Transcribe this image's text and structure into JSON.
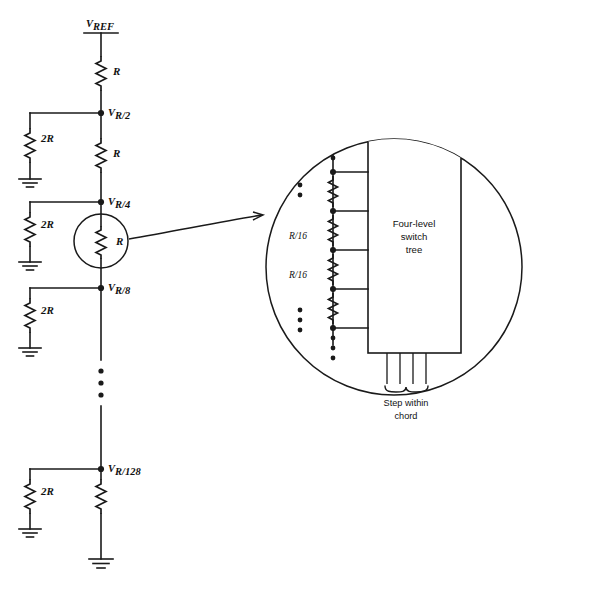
{
  "figure": {
    "background_color": "#ffffff",
    "line_color": "#1a1a1a"
  },
  "ladder": {
    "supply_label": "V",
    "supply_subscript": "REF",
    "series_resistor_label": "R",
    "shunt_resistor_label": "2R",
    "nodes": [
      {
        "label": "V",
        "subscript": "R/2"
      },
      {
        "label": "V",
        "subscript": "R/4"
      },
      {
        "label": "V",
        "subscript": "R/8"
      },
      {
        "label": "V",
        "subscript": "R/128"
      }
    ],
    "series_resistors": [
      "R",
      "R",
      "R"
    ],
    "shunt_resistors": [
      "2R",
      "2R",
      "2R",
      "2R"
    ],
    "ellipsis": "⋮",
    "ground_symbol": "gnd"
  },
  "detail": {
    "callout_resistor_label": "R",
    "subdivision_resistor_labels": [
      "R/16",
      "R/16"
    ],
    "switch_tree_lines": [
      "Four-level",
      "switch",
      "tree"
    ],
    "output_caption_lines": [
      "Step  within",
      "chord"
    ],
    "tap_count": 5,
    "output_line_count": 4,
    "ellipsis_top": "⋮",
    "ellipsis_upper": "⋮",
    "ellipsis_lower": "⋮",
    "ellipsis_bottom": "⋮"
  }
}
